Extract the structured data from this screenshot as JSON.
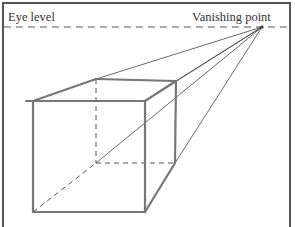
{
  "labels": {
    "eye_level": "Eye level",
    "vanishing_point": "Vanishing point"
  },
  "colors": {
    "line": "#555555",
    "sketch": "#777777",
    "background": "#ffffff"
  },
  "geometry": {
    "vanishing_point": [
      262,
      27
    ],
    "eye_level_y": 27,
    "front_face": {
      "tl": [
        33,
        101
      ],
      "tr": [
        145,
        101
      ],
      "br": [
        145,
        212
      ],
      "bl": [
        33,
        212
      ]
    },
    "back_face": {
      "tl": [
        96,
        79
      ],
      "tr": [
        176,
        81
      ],
      "br": [
        175,
        163
      ],
      "bl": [
        96,
        163
      ]
    }
  }
}
